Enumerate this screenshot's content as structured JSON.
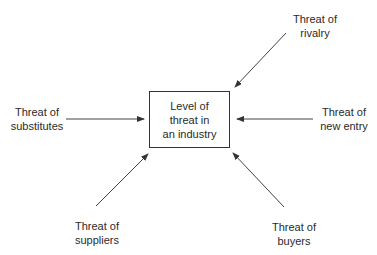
{
  "diagram": {
    "center": {
      "label": "Level of\nthreat in\nan industry"
    },
    "forces": [
      {
        "id": "rivalry",
        "label": "Threat of\nrivalry",
        "position": "top-right"
      },
      {
        "id": "substitutes",
        "label": "Threat of\nsubstitutes",
        "position": "left"
      },
      {
        "id": "new_entry",
        "label": "Threat of\nnew entry",
        "position": "right"
      },
      {
        "id": "suppliers",
        "label": "Threat of\nsuppliers",
        "position": "bottom-left"
      },
      {
        "id": "buyers",
        "label": "Threat of\nbuyers",
        "position": "bottom-right"
      }
    ],
    "colors": {
      "line": "#333333",
      "text": "#2a2a2a",
      "background": "#ffffff"
    }
  }
}
